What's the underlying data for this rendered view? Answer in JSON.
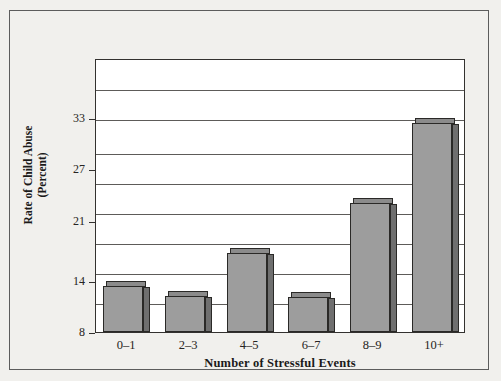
{
  "chart_data": {
    "type": "bar",
    "title": "",
    "xlabel": "Number of Stressful Events",
    "ylabel": "Rate of Child Abuse (Percent)",
    "ylabel_line1": "Rate of Child Abuse",
    "ylabel_line2": "(Percent)",
    "categories": [
      "0–1",
      "2–3",
      "4–5",
      "6–7",
      "8–9",
      "10+"
    ],
    "values": [
      14.0,
      12.8,
      17.8,
      12.7,
      23.6,
      33.0
    ],
    "ylim": [
      8,
      40
    ],
    "ytick_labels": [
      "8",
      "14",
      "21",
      "27",
      "33"
    ],
    "ytick_values": [
      8,
      14,
      21,
      27,
      33
    ],
    "gridline_values": [
      11.5,
      15.0,
      18.5,
      22.0,
      25.5,
      29.0,
      33.0,
      36.5
    ],
    "grid": true,
    "legend": "none",
    "bar_fill_color": "#9d9d9d",
    "bar_side_color": "#6f6f6f",
    "bar_edge_color": "#2a2927",
    "plot_background": "#ffffff",
    "figure_background": "#f1f0ed",
    "frame_color": "#5c5c5c"
  }
}
